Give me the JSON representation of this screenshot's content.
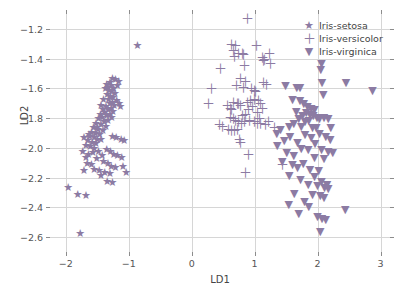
{
  "chart_data": {
    "type": "scatter",
    "title": "",
    "xlabel": "LD1",
    "ylabel": "LD2",
    "xlim": [
      -2.25,
      3.15
    ],
    "ylim": [
      -2.7,
      -1.1
    ],
    "xticks": [
      -2,
      -1,
      0,
      1,
      2,
      3
    ],
    "xticklabels": [
      "−2",
      "−1",
      "0",
      "1",
      "2",
      "3"
    ],
    "yticks": [
      -1.2,
      -1.4,
      -1.6,
      -1.8,
      -2.0,
      -2.2,
      -2.4,
      -2.6
    ],
    "yticklabels": [
      "−1.2",
      "−1.4",
      "−1.6",
      "−1.8",
      "−2.0",
      "−2.2",
      "−2.4",
      "−2.6"
    ],
    "grid": true,
    "legend_position": "upper right",
    "marker_color": "#8c7ba3",
    "grid_color": "#d6d6d6",
    "series": [
      {
        "name": "Iris-setosa",
        "marker": "star",
        "glyph": "★",
        "color": "#8c7ba3",
        "points": [
          [
            -1.26,
            -1.53
          ],
          [
            -1.21,
            -1.54
          ],
          [
            -1.16,
            -1.55
          ],
          [
            -1.3,
            -1.56
          ],
          [
            -1.35,
            -1.57
          ],
          [
            -1.28,
            -1.58
          ],
          [
            -1.33,
            -1.59
          ],
          [
            -1.24,
            -1.6
          ],
          [
            -1.37,
            -1.6
          ],
          [
            -1.31,
            -1.61
          ],
          [
            -1.27,
            -1.62
          ],
          [
            -1.22,
            -1.63
          ],
          [
            -1.34,
            -1.64
          ],
          [
            -1.29,
            -1.65
          ],
          [
            -1.25,
            -1.66
          ],
          [
            -1.32,
            -1.67
          ],
          [
            -1.19,
            -1.68
          ],
          [
            -1.26,
            -1.69
          ],
          [
            -1.3,
            -1.7
          ],
          [
            -1.23,
            -1.71
          ],
          [
            -1.13,
            -1.72
          ],
          [
            -1.36,
            -1.72
          ],
          [
            -1.28,
            -1.73
          ],
          [
            -1.33,
            -1.74
          ],
          [
            -1.41,
            -1.74
          ],
          [
            -1.25,
            -1.75
          ],
          [
            -1.38,
            -1.76
          ],
          [
            -1.3,
            -1.77
          ],
          [
            -1.45,
            -1.77
          ],
          [
            -1.35,
            -1.78
          ],
          [
            -1.27,
            -1.79
          ],
          [
            -1.42,
            -1.79
          ],
          [
            -1.48,
            -1.8
          ],
          [
            -1.33,
            -1.81
          ],
          [
            -1.39,
            -1.82
          ],
          [
            -1.52,
            -1.83
          ],
          [
            -1.44,
            -1.84
          ],
          [
            -1.36,
            -1.85
          ],
          [
            -1.56,
            -1.86
          ],
          [
            -1.49,
            -1.87
          ],
          [
            -1.41,
            -1.88
          ],
          [
            -1.59,
            -1.89
          ],
          [
            -1.53,
            -1.9
          ],
          [
            -1.46,
            -1.91
          ],
          [
            -1.62,
            -1.92
          ],
          [
            -1.55,
            -1.93
          ],
          [
            -1.5,
            -1.94
          ],
          [
            -1.65,
            -1.95
          ],
          [
            -1.58,
            -1.96
          ],
          [
            -1.52,
            -1.97
          ],
          [
            -1.68,
            -1.98
          ],
          [
            -1.61,
            -1.99
          ],
          [
            -1.55,
            -2.0
          ],
          [
            -1.44,
            -1.94
          ],
          [
            -1.2,
            -1.93
          ],
          [
            -1.12,
            -1.94
          ],
          [
            -1.07,
            -1.95
          ],
          [
            -1.26,
            -1.92
          ],
          [
            -1.63,
            -1.91
          ],
          [
            -1.71,
            -1.93
          ],
          [
            -1.48,
            -2.02
          ],
          [
            -1.57,
            -2.03
          ],
          [
            -1.64,
            -2.04
          ],
          [
            -1.42,
            -2.05
          ],
          [
            -1.68,
            -2.06
          ],
          [
            -1.51,
            -2.07
          ],
          [
            -1.35,
            -2.01
          ],
          [
            -1.29,
            -2.02
          ],
          [
            -1.24,
            -2.04
          ],
          [
            -1.18,
            -2.05
          ],
          [
            -1.11,
            -2.06
          ],
          [
            -1.4,
            -2.09
          ],
          [
            -1.33,
            -2.1
          ],
          [
            -1.73,
            -2.02
          ],
          [
            -1.66,
            -2.1
          ],
          [
            -1.59,
            -2.11
          ],
          [
            -1.28,
            -2.12
          ],
          [
            -1.21,
            -2.13
          ],
          [
            -1.09,
            -2.12
          ],
          [
            -1.55,
            -2.14
          ],
          [
            -1.47,
            -2.15
          ],
          [
            -1.38,
            -2.16
          ],
          [
            -1.04,
            -2.16
          ],
          [
            -1.3,
            -2.17
          ],
          [
            -1.44,
            -2.18
          ],
          [
            -1.71,
            -2.15
          ],
          [
            -1.34,
            -2.22
          ],
          [
            -1.26,
            -2.23
          ],
          [
            -1.96,
            -2.26
          ],
          [
            -1.81,
            -2.31
          ],
          [
            -1.68,
            -2.32
          ],
          [
            -0.86,
            -1.31
          ],
          [
            -1.77,
            -2.57
          ],
          [
            -1.15,
            -1.7
          ],
          [
            -1.18,
            -1.58
          ],
          [
            -1.4,
            -1.67
          ],
          [
            -1.44,
            -1.71
          ],
          [
            -1.5,
            -1.86
          ]
        ]
      },
      {
        "name": "Iris-versicolor",
        "marker": "plus",
        "glyph": "＋",
        "color": "#8c7ba3",
        "points": [
          [
            0.89,
            -1.13
          ],
          [
            0.63,
            -1.3
          ],
          [
            0.7,
            -1.31
          ],
          [
            1.03,
            -1.31
          ],
          [
            0.66,
            -1.34
          ],
          [
            0.74,
            -1.36
          ],
          [
            0.8,
            -1.36
          ],
          [
            0.82,
            -1.37
          ],
          [
            0.68,
            -1.38
          ],
          [
            1.24,
            -1.36
          ],
          [
            1.12,
            -1.39
          ],
          [
            1.16,
            -1.4
          ],
          [
            1.14,
            -1.41
          ],
          [
            0.45,
            -1.46
          ],
          [
            0.84,
            -1.44
          ],
          [
            1.25,
            -1.43
          ],
          [
            0.77,
            -1.53
          ],
          [
            0.86,
            -1.55
          ],
          [
            0.31,
            -1.6
          ],
          [
            0.71,
            -1.58
          ],
          [
            1.14,
            -1.56
          ],
          [
            1.19,
            -1.57
          ],
          [
            0.83,
            -1.59
          ],
          [
            0.95,
            -1.6
          ],
          [
            0.99,
            -1.61
          ],
          [
            1.02,
            -1.62
          ],
          [
            0.26,
            -1.7
          ],
          [
            0.67,
            -1.69
          ],
          [
            0.72,
            -1.7
          ],
          [
            0.75,
            -1.7
          ],
          [
            0.78,
            -1.71
          ],
          [
            0.88,
            -1.69
          ],
          [
            0.93,
            -1.68
          ],
          [
            1.0,
            -1.67
          ],
          [
            1.06,
            -1.68
          ],
          [
            1.09,
            -1.7
          ],
          [
            0.97,
            -1.72
          ],
          [
            0.9,
            -1.74
          ],
          [
            0.61,
            -1.79
          ],
          [
            0.66,
            -1.8
          ],
          [
            0.7,
            -1.81
          ],
          [
            0.74,
            -1.82
          ],
          [
            0.8,
            -1.78
          ],
          [
            0.85,
            -1.77
          ],
          [
            1.05,
            -1.76
          ],
          [
            0.44,
            -1.84
          ],
          [
            0.49,
            -1.85
          ],
          [
            0.99,
            -1.82
          ],
          [
            1.04,
            -1.83
          ],
          [
            1.1,
            -1.83
          ],
          [
            1.18,
            -1.84
          ],
          [
            1.31,
            -1.86
          ],
          [
            0.58,
            -1.87
          ],
          [
            0.63,
            -1.88
          ],
          [
            0.68,
            -1.88
          ],
          [
            0.72,
            -1.87
          ],
          [
            0.79,
            -1.83
          ],
          [
            0.84,
            -1.82
          ],
          [
            0.76,
            -1.94
          ],
          [
            0.78,
            -1.96
          ],
          [
            0.9,
            -2.04
          ],
          [
            1.07,
            -1.8
          ],
          [
            1.22,
            -1.82
          ],
          [
            1.45,
            -2.11
          ],
          [
            0.86,
            -2.16
          ],
          [
            0.57,
            -1.71
          ],
          [
            0.61,
            -1.73
          ],
          [
            0.64,
            -1.74
          ],
          [
            1.12,
            -1.73
          ],
          [
            0.92,
            -1.81
          ]
        ]
      },
      {
        "name": "Iris-virginica",
        "marker": "triangle-down",
        "glyph": "▼",
        "color": "#8c7ba3",
        "points": [
          [
            2.06,
            -1.43
          ],
          [
            2.05,
            -1.47
          ],
          [
            2.07,
            -1.56
          ],
          [
            2.45,
            -1.56
          ],
          [
            2.87,
            -1.61
          ],
          [
            1.49,
            -1.58
          ],
          [
            1.67,
            -1.59
          ],
          [
            1.72,
            -1.59
          ],
          [
            2.09,
            -1.64
          ],
          [
            1.6,
            -1.67
          ],
          [
            1.72,
            -1.68
          ],
          [
            1.78,
            -1.7
          ],
          [
            1.84,
            -1.72
          ],
          [
            1.9,
            -1.73
          ],
          [
            1.95,
            -1.74
          ],
          [
            1.66,
            -1.75
          ],
          [
            1.82,
            -1.76
          ],
          [
            1.88,
            -1.77
          ],
          [
            1.76,
            -1.78
          ],
          [
            1.93,
            -1.78
          ],
          [
            1.99,
            -1.79
          ],
          [
            2.03,
            -1.8
          ],
          [
            1.7,
            -1.8
          ],
          [
            1.86,
            -1.81
          ],
          [
            1.8,
            -1.82
          ],
          [
            2.1,
            -1.79
          ],
          [
            2.17,
            -1.8
          ],
          [
            1.62,
            -1.83
          ],
          [
            1.55,
            -1.85
          ],
          [
            1.74,
            -1.85
          ],
          [
            1.92,
            -1.86
          ],
          [
            1.41,
            -1.87
          ],
          [
            1.98,
            -1.86
          ],
          [
            1.35,
            -1.9
          ],
          [
            1.56,
            -1.92
          ],
          [
            1.8,
            -1.91
          ],
          [
            2.03,
            -1.9
          ],
          [
            1.47,
            -1.95
          ],
          [
            1.68,
            -1.96
          ],
          [
            1.9,
            -1.93
          ],
          [
            2.13,
            -1.92
          ],
          [
            2.2,
            -1.94
          ],
          [
            1.96,
            -1.97
          ],
          [
            1.36,
            -1.98
          ],
          [
            1.74,
            -2.0
          ],
          [
            1.85,
            -2.01
          ],
          [
            2.06,
            -2.01
          ],
          [
            2.17,
            -2.02
          ],
          [
            1.51,
            -2.03
          ],
          [
            2.24,
            -2.03
          ],
          [
            1.62,
            -2.05
          ],
          [
            1.95,
            -2.06
          ],
          [
            2.1,
            -2.07
          ],
          [
            1.44,
            -2.09
          ],
          [
            1.77,
            -2.1
          ],
          [
            1.68,
            -2.13
          ],
          [
            1.88,
            -2.14
          ],
          [
            2.02,
            -2.15
          ],
          [
            1.55,
            -2.18
          ],
          [
            1.95,
            -2.19
          ],
          [
            1.73,
            -2.21
          ],
          [
            2.06,
            -2.22
          ],
          [
            1.85,
            -2.24
          ],
          [
            2.0,
            -2.25
          ],
          [
            2.11,
            -2.26
          ],
          [
            2.17,
            -2.27
          ],
          [
            1.63,
            -2.3
          ],
          [
            1.92,
            -2.31
          ],
          [
            2.04,
            -2.32
          ],
          [
            2.1,
            -2.33
          ],
          [
            1.79,
            -2.36
          ],
          [
            1.54,
            -2.38
          ],
          [
            1.86,
            -2.39
          ],
          [
            2.44,
            -2.41
          ],
          [
            1.7,
            -2.44
          ],
          [
            2.0,
            -2.46
          ],
          [
            2.07,
            -2.47
          ],
          [
            2.13,
            -2.48
          ],
          [
            2.04,
            -2.56
          ],
          [
            2.15,
            -2.24
          ],
          [
            1.6,
            -2.11
          ],
          [
            2.21,
            -1.86
          ]
        ]
      }
    ]
  },
  "legend": {
    "items": [
      {
        "label": "Iris-setosa",
        "glyph": "★"
      },
      {
        "label": "Iris-versicolor",
        "glyph": "＋"
      },
      {
        "label": "Iris-virginica",
        "glyph": "▼"
      }
    ]
  }
}
